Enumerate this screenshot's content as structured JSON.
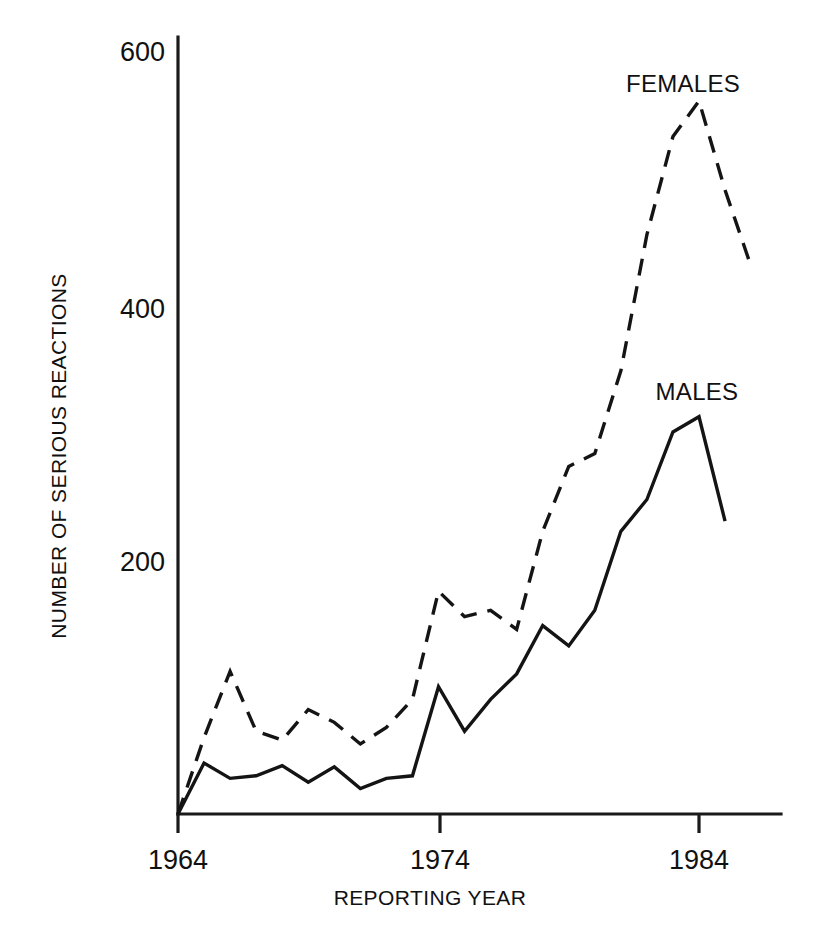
{
  "chart_data": {
    "type": "line",
    "title": "",
    "subtitle": "",
    "xlabel": "REPORTING YEAR",
    "ylabel": "NUMBER OF SERIOUS REACTIONS",
    "xlim": [
      1964,
      1987
    ],
    "ylim": [
      0,
      600
    ],
    "xticks": [
      1964,
      1974,
      1984
    ],
    "xtick_labels": [
      "1964",
      "1974",
      "1984"
    ],
    "yticks": [
      200,
      400,
      600
    ],
    "ytick_labels": [
      "200",
      "400",
      "600"
    ],
    "grid": false,
    "legend_position": "inline-annotations",
    "x": [
      1964,
      1965,
      1966,
      1967,
      1968,
      1969,
      1970,
      1971,
      1972,
      1973,
      1974,
      1975,
      1976,
      1977,
      1978,
      1979,
      1980,
      1981,
      1982,
      1983,
      1984,
      1985,
      1986
    ],
    "series": [
      {
        "name": "MALES",
        "style": "solid",
        "color": "#141414",
        "values": [
          0,
          40,
          28,
          30,
          38,
          25,
          37,
          20,
          28,
          30,
          100,
          65,
          90,
          110,
          148,
          132,
          160,
          222,
          247,
          300,
          312,
          230,
          null
        ]
      },
      {
        "name": "FEMALES",
        "style": "dashed",
        "color": "#141414",
        "values": [
          0,
          60,
          112,
          65,
          58,
          82,
          72,
          55,
          68,
          90,
          175,
          155,
          160,
          145,
          222,
          273,
          283,
          348,
          455,
          532,
          560,
          490,
          430
        ]
      }
    ],
    "annotations": [
      {
        "text": "FEMALES",
        "x": 1983,
        "y": 600
      },
      {
        "text": "MALES",
        "x": 1983,
        "y": 355
      }
    ]
  },
  "labels": {
    "y_axis_title": "NUMBER OF SERIOUS REACTIONS",
    "x_axis_title": "REPORTING YEAR",
    "ytick_600": "600",
    "ytick_400": "400",
    "ytick_200": "200",
    "xtick_1964": "1964",
    "xtick_1974": "1974",
    "xtick_1984": "1984",
    "series_females": "FEMALES",
    "series_males": "MALES"
  },
  "colors": {
    "background": "#ffffff",
    "ink": "#141414",
    "axis": "#1a1a1a"
  }
}
